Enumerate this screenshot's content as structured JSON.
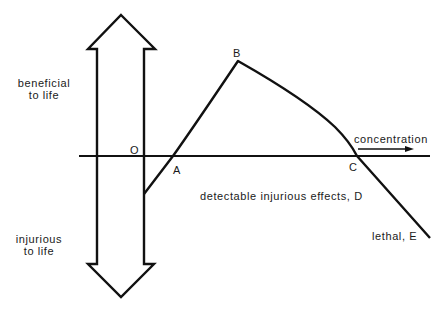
{
  "diagram": {
    "side_labels": {
      "beneficial_line1": "beneficial",
      "beneficial_line2": "to life",
      "injurious_line1": "injurious",
      "injurious_line2": "to life"
    },
    "axis_label": "concentration",
    "points": {
      "O": "O",
      "A": "A",
      "B": "B",
      "C": "C"
    },
    "annotations": {
      "D": "detectable injurious effects, D",
      "E": "lethal, E"
    },
    "colors": {
      "line": "#111111",
      "background": "#ffffff"
    }
  }
}
